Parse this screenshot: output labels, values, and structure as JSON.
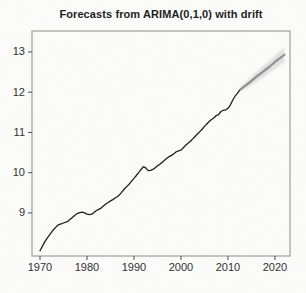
{
  "figure": {
    "title": "Forecasts from ARIMA(0,1,0) with drift",
    "background": "#fcfcfb"
  },
  "axis_style": {
    "tick_color": "#4a4a4a",
    "label_color": "#2e2e2e",
    "box_color": "#8a8a8a",
    "tick_font_px": 11
  },
  "chart_data": {
    "type": "line",
    "title": "Forecasts from ARIMA(0,1,0) with drift",
    "xlabel": "",
    "ylabel": "",
    "xlim": [
      1968.3,
      2023.2
    ],
    "ylim": [
      7.93,
      13.52
    ],
    "x_ticks": [
      1970,
      1980,
      1990,
      2000,
      2010,
      2020
    ],
    "y_ticks": [
      9,
      10,
      11,
      12,
      13
    ],
    "grid": false,
    "legend": null,
    "series": [
      {
        "name": "observed",
        "color": "#1c1c1c",
        "width": 1.3,
        "x": [
          1970,
          1970.5,
          1971,
          1971.5,
          1972,
          1972.5,
          1973,
          1973.5,
          1974,
          1974.5,
          1975,
          1975.5,
          1976,
          1976.5,
          1977,
          1977.5,
          1978,
          1978.5,
          1979,
          1979.5,
          1980,
          1980.5,
          1981,
          1981.5,
          1982,
          1982.5,
          1983,
          1983.5,
          1984,
          1984.5,
          1985,
          1985.5,
          1986,
          1986.5,
          1987,
          1987.5,
          1988,
          1988.5,
          1989,
          1989.5,
          1990,
          1990.5,
          1991,
          1991.5,
          1992,
          1992.5,
          1993,
          1993.5,
          1994,
          1994.5,
          1995,
          1995.5,
          1996,
          1996.5,
          1997,
          1997.5,
          1998,
          1998.5,
          1999,
          1999.5,
          2000,
          2000.5,
          2001,
          2001.5,
          2002,
          2002.5,
          2003,
          2003.5,
          2004,
          2004.5,
          2005,
          2005.5,
          2006,
          2006.5,
          2007,
          2007.5,
          2008,
          2008.5,
          2009,
          2009.5,
          2010,
          2010.5,
          2011,
          2011.5,
          2012,
          2012.5
        ],
        "y": [
          8.06,
          8.17,
          8.28,
          8.37,
          8.45,
          8.53,
          8.6,
          8.66,
          8.71,
          8.73,
          8.75,
          8.77,
          8.8,
          8.85,
          8.9,
          8.95,
          8.99,
          9.01,
          9.02,
          9.0,
          8.97,
          8.96,
          8.97,
          9.01,
          9.06,
          9.09,
          9.12,
          9.17,
          9.22,
          9.26,
          9.3,
          9.33,
          9.37,
          9.41,
          9.46,
          9.53,
          9.6,
          9.66,
          9.72,
          9.79,
          9.86,
          9.93,
          10.0,
          10.08,
          10.15,
          10.12,
          10.05,
          10.06,
          10.08,
          10.12,
          10.17,
          10.21,
          10.26,
          10.31,
          10.36,
          10.4,
          10.43,
          10.47,
          10.52,
          10.54,
          10.56,
          10.62,
          10.68,
          10.73,
          10.78,
          10.84,
          10.9,
          10.96,
          11.02,
          11.08,
          11.15,
          11.21,
          11.27,
          11.32,
          11.36,
          11.42,
          11.44,
          11.52,
          11.55,
          11.56,
          11.6,
          11.68,
          11.8,
          11.9,
          11.97,
          12.05
        ]
      },
      {
        "name": "forecast-mean",
        "color": "#8f8f8f",
        "width": 2.2,
        "x": [
          2012.7,
          2013,
          2014,
          2015,
          2016,
          2017,
          2018,
          2019,
          2020,
          2021,
          2022
        ],
        "y": [
          12.07,
          12.1,
          12.19,
          12.28,
          12.38,
          12.47,
          12.56,
          12.65,
          12.75,
          12.84,
          12.93
        ]
      }
    ],
    "band": {
      "name": "forecast-interval",
      "color": "#dcdcdc",
      "x": [
        2012.7,
        2013,
        2014,
        2015,
        2016,
        2017,
        2018,
        2019,
        2020,
        2021,
        2022
      ],
      "upper": [
        12.09,
        12.16,
        12.28,
        12.39,
        12.5,
        12.6,
        12.7,
        12.8,
        12.91,
        13.01,
        13.11
      ],
      "lower": [
        12.05,
        12.04,
        12.1,
        12.17,
        12.25,
        12.33,
        12.41,
        12.5,
        12.58,
        12.67,
        12.75
      ]
    }
  }
}
